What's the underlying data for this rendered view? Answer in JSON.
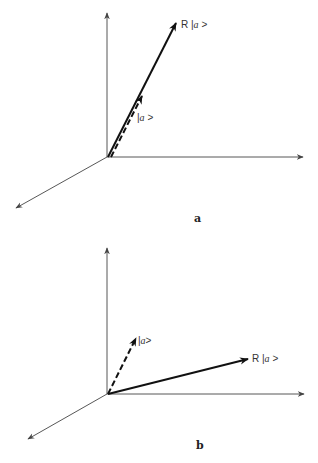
{
  "figure": {
    "panels": [
      {
        "id": "a",
        "label": "a",
        "vectors": [
          {
            "name": "R|a>",
            "style": "solid",
            "label_prefix": "R  |",
            "label_italic": "a",
            "label_suffix": " >"
          },
          {
            "name": "|a>",
            "style": "dashed",
            "label_prefix": "|",
            "label_italic": "a",
            "label_suffix": " >"
          }
        ],
        "description": "R|a> is parallel to |a> (eigenvector)"
      },
      {
        "id": "b",
        "label": "b",
        "vectors": [
          {
            "name": "|a>",
            "style": "dashed",
            "label_prefix": "|",
            "label_italic": "a",
            "label_suffix": ">"
          },
          {
            "name": "R|a>",
            "style": "solid",
            "label_prefix": "R  |",
            "label_italic": "a",
            "label_suffix": " >"
          }
        ],
        "description": "R|a> points in a different direction from |a>"
      }
    ]
  },
  "colors": {
    "axis": "#444444",
    "vector": "#111111",
    "background": "#ffffff"
  }
}
